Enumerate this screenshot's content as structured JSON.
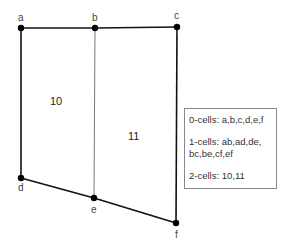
{
  "vertices": [
    {
      "id": "a",
      "label": "a",
      "x": 21,
      "y": 28
    },
    {
      "id": "b",
      "label": "b",
      "x": 95,
      "y": 28
    },
    {
      "id": "c",
      "label": "c",
      "x": 177,
      "y": 27
    },
    {
      "id": "d",
      "label": "d",
      "x": 21,
      "y": 178
    },
    {
      "id": "e",
      "label": "e",
      "x": 94,
      "y": 198
    },
    {
      "id": "f",
      "label": "f",
      "x": 176,
      "y": 223
    }
  ],
  "edges": [
    "ab",
    "bc",
    "ad",
    "de",
    "ef",
    "cf",
    "be"
  ],
  "faces": [
    {
      "id": "10",
      "label": "10"
    },
    {
      "id": "11",
      "label": "11"
    }
  ],
  "legend": {
    "zero_cells": "0-cells: a,b,c,d,e,f",
    "one_cells_line1": "1-cells: ab,ad,de,",
    "one_cells_line2": "bc,be,cf,ef",
    "two_cells": "2-cells: 10,11"
  }
}
